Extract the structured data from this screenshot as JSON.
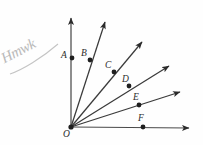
{
  "figure": {
    "kind": "geometry-ray-diagram",
    "background_color": "#fefefe",
    "stroke_color": "#2b2b2b",
    "origin": {
      "label": "O",
      "x": 71,
      "y": 127,
      "label_x": 63,
      "label_y": 130
    },
    "rays": [
      {
        "name": "vertical-axis-ray",
        "from_x": 71,
        "from_y": 127,
        "to_x": 71,
        "to_y": 18,
        "arrow": true
      },
      {
        "name": "ray-through-b",
        "from_x": 71,
        "from_y": 127,
        "to_x": 105,
        "to_y": 22,
        "arrow": true
      },
      {
        "name": "ray-through-c",
        "from_x": 71,
        "from_y": 127,
        "to_x": 142,
        "to_y": 42,
        "arrow": true
      },
      {
        "name": "ray-through-d",
        "from_x": 71,
        "from_y": 127,
        "to_x": 169,
        "to_y": 66,
        "arrow": true
      },
      {
        "name": "ray-through-e",
        "from_x": 71,
        "from_y": 127,
        "to_x": 180,
        "to_y": 92,
        "arrow": true
      },
      {
        "name": "horizontal-axis-ray",
        "from_x": 71,
        "from_y": 127,
        "to_x": 189,
        "to_y": 128,
        "arrow": true
      }
    ],
    "points": [
      {
        "label": "A",
        "x": 72,
        "y": 58,
        "label_x": 61,
        "label_y": 51
      },
      {
        "label": "B",
        "x": 90,
        "y": 60,
        "label_x": 81,
        "label_y": 49
      },
      {
        "label": "C",
        "x": 114,
        "y": 72,
        "label_x": 105,
        "label_y": 61
      },
      {
        "label": "D",
        "x": 129,
        "y": 86,
        "label_x": 122,
        "label_y": 75
      },
      {
        "label": "E",
        "x": 139,
        "y": 105,
        "label_x": 133,
        "label_y": 93
      },
      {
        "label": "F",
        "x": 143,
        "y": 127,
        "label_x": 138,
        "label_y": 114
      }
    ],
    "annotation": {
      "text": "Hmwk",
      "x": 6,
      "y": 62,
      "color": "#b9b9b9",
      "underline": true
    }
  }
}
